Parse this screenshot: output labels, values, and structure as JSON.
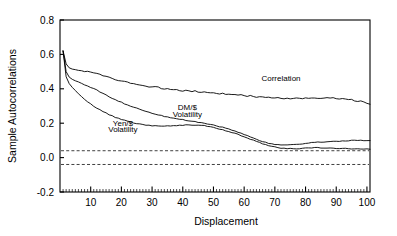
{
  "chart_data": {
    "type": "line",
    "title": "",
    "xlabel": "Displacement",
    "ylabel": "Sample Autocorrelations",
    "xlim": [
      0,
      101
    ],
    "ylim": [
      -0.2,
      0.8
    ],
    "xticks": [
      10,
      20,
      30,
      40,
      50,
      60,
      70,
      80,
      90,
      100
    ],
    "xtick_labels": [
      "10",
      "20",
      "30",
      "40",
      "50",
      "60",
      "70",
      "80",
      "90",
      "100"
    ],
    "x_minor_tick_step": 1,
    "yticks": [
      -0.2,
      0.0,
      0.2,
      0.4,
      0.6,
      0.8
    ],
    "ytick_labels": [
      "-0.2",
      "0.0",
      "0.2",
      "0.4",
      "0.6",
      "0.8"
    ],
    "grid": false,
    "legend": "inline-annotations",
    "line_color": "#000000",
    "confidence_bands": {
      "upper": 0.04,
      "lower": -0.04,
      "style": "dashed",
      "color": "#404040"
    },
    "annotations": [
      {
        "text": "Correlation",
        "x": 72,
        "y": 0.445
      },
      {
        "text": "DM/$",
        "x": 41.5,
        "y": 0.275
      },
      {
        "text": "Volatility",
        "x": 41.5,
        "y": 0.238
      },
      {
        "text": "Yen/$",
        "x": 20.5,
        "y": 0.185
      },
      {
        "text": "Volatility",
        "x": 20.5,
        "y": 0.148
      }
    ],
    "series": [
      {
        "name": "Correlation",
        "values": [
          0.62,
          0.545,
          0.522,
          0.515,
          0.512,
          0.508,
          0.505,
          0.502,
          0.5,
          0.497,
          0.492,
          0.487,
          0.482,
          0.477,
          0.472,
          0.466,
          0.461,
          0.455,
          0.45,
          0.446,
          0.442,
          0.437,
          0.433,
          0.429,
          0.425,
          0.421,
          0.418,
          0.415,
          0.412,
          0.41,
          0.415,
          0.41,
          0.403,
          0.399,
          0.404,
          0.397,
          0.393,
          0.397,
          0.391,
          0.388,
          0.392,
          0.387,
          0.383,
          0.387,
          0.382,
          0.378,
          0.381,
          0.377,
          0.374,
          0.377,
          0.373,
          0.37,
          0.373,
          0.369,
          0.366,
          0.369,
          0.365,
          0.362,
          0.364,
          0.36,
          0.357,
          0.359,
          0.356,
          0.353,
          0.355,
          0.352,
          0.35,
          0.352,
          0.349,
          0.347,
          0.349,
          0.346,
          0.344,
          0.347,
          0.344,
          0.343,
          0.346,
          0.344,
          0.343,
          0.346,
          0.345,
          0.344,
          0.347,
          0.346,
          0.345,
          0.348,
          0.347,
          0.345,
          0.347,
          0.344,
          0.341,
          0.343,
          0.339,
          0.335,
          0.336,
          0.331,
          0.327,
          0.328,
          0.322,
          0.316,
          0.31
        ]
      },
      {
        "name": "DM/$ Volatility",
        "values": [
          0.62,
          0.5,
          0.468,
          0.455,
          0.447,
          0.44,
          0.432,
          0.424,
          0.416,
          0.408,
          0.4,
          0.392,
          0.383,
          0.374,
          0.364,
          0.355,
          0.346,
          0.337,
          0.329,
          0.321,
          0.313,
          0.306,
          0.299,
          0.293,
          0.287,
          0.281,
          0.275,
          0.27,
          0.264,
          0.259,
          0.254,
          0.249,
          0.244,
          0.24,
          0.236,
          0.232,
          0.229,
          0.226,
          0.223,
          0.22,
          0.217,
          0.214,
          0.211,
          0.208,
          0.205,
          0.202,
          0.199,
          0.196,
          0.192,
          0.188,
          0.184,
          0.18,
          0.176,
          0.171,
          0.166,
          0.16,
          0.154,
          0.148,
          0.141,
          0.134,
          0.127,
          0.12,
          0.113,
          0.106,
          0.099,
          0.093,
          0.088,
          0.083,
          0.079,
          0.076,
          0.074,
          0.073,
          0.072,
          0.072,
          0.073,
          0.074,
          0.076,
          0.078,
          0.08,
          0.082,
          0.084,
          0.086,
          0.088,
          0.089,
          0.09,
          0.091,
          0.092,
          0.093,
          0.094,
          0.095,
          0.096,
          0.097,
          0.098,
          0.098,
          0.099,
          0.099,
          0.1,
          0.1,
          0.1,
          0.099,
          0.098
        ]
      },
      {
        "name": "Yen/$ Volatility",
        "values": [
          0.62,
          0.47,
          0.43,
          0.408,
          0.39,
          0.372,
          0.355,
          0.34,
          0.326,
          0.313,
          0.3,
          0.289,
          0.278,
          0.268,
          0.259,
          0.25,
          0.242,
          0.235,
          0.228,
          0.222,
          0.216,
          0.211,
          0.206,
          0.202,
          0.198,
          0.195,
          0.192,
          0.19,
          0.188,
          0.186,
          0.185,
          0.184,
          0.183,
          0.183,
          0.183,
          0.184,
          0.185,
          0.186,
          0.187,
          0.188,
          0.189,
          0.19,
          0.19,
          0.19,
          0.189,
          0.187,
          0.185,
          0.182,
          0.178,
          0.174,
          0.17,
          0.166,
          0.161,
          0.156,
          0.151,
          0.146,
          0.14,
          0.134,
          0.128,
          0.122,
          0.115,
          0.108,
          0.101,
          0.094,
          0.087,
          0.081,
          0.075,
          0.07,
          0.065,
          0.061,
          0.058,
          0.056,
          0.054,
          0.053,
          0.052,
          0.052,
          0.052,
          0.053,
          0.054,
          0.055,
          0.056,
          0.056,
          0.057,
          0.057,
          0.057,
          0.056,
          0.056,
          0.055,
          0.055,
          0.054,
          0.054,
          0.053,
          0.053,
          0.052,
          0.052,
          0.051,
          0.051,
          0.05,
          0.05,
          0.05,
          0.05
        ]
      }
    ]
  }
}
